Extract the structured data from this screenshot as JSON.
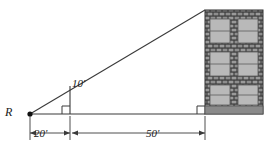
{
  "figure": {
    "type": "geometry-diagram",
    "labels": {
      "point_r": "R",
      "pole_height": "10'",
      "segment_r_to_pole": "20'",
      "segment_pole_to_building": "50'"
    },
    "units": "feet",
    "measurements": {
      "pole_height_ft": 10,
      "distance_r_to_pole_ft": 20,
      "distance_pole_to_building_ft": 50,
      "total_base_ft": 70
    },
    "markers": {
      "right_angle_at_pole": true,
      "right_angle_at_building": true,
      "vertex_point_marker": "filled-dot"
    },
    "building": {
      "facade": "brick",
      "window_rows": 3,
      "window_columns": 2,
      "window_total": 6,
      "window_panes_each": 2,
      "has_foundation_band": true
    },
    "colors": {
      "line": "#3a3a3a",
      "brick_dark": "#4a4a4a",
      "brick_light": "#8f8f8f",
      "window_glass": "#b9b9b9",
      "foundation": "#8a8a8a",
      "background": "#ffffff",
      "text": "#1a1a1a"
    },
    "geometry_px": {
      "point_r": [
        30,
        114
      ],
      "pole_base": [
        70,
        114
      ],
      "pole_top": [
        70,
        86
      ],
      "building_base": [
        205,
        114
      ],
      "building_top": [
        205,
        10
      ],
      "dimension_line_y": 133
    }
  }
}
